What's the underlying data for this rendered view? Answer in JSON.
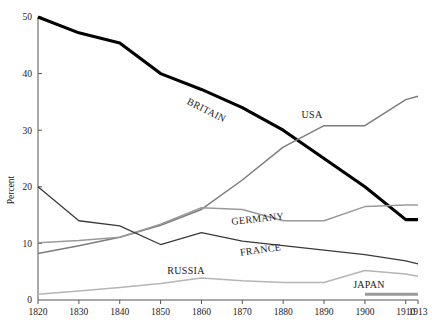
{
  "chart_data": {
    "type": "line",
    "title": "",
    "xlabel": "",
    "ylabel": "Percent",
    "xlim": [
      1820,
      1913
    ],
    "ylim": [
      0,
      50
    ],
    "grid": false,
    "legend": "inline-labels",
    "x": [
      1820,
      1830,
      1840,
      1850,
      1860,
      1870,
      1880,
      1890,
      1900,
      1910,
      1913
    ],
    "xticklabels": [
      "1820",
      "1830",
      "1840",
      "1850",
      "1860",
      "1870",
      "1880",
      "1890",
      "1900",
      "1910",
      "1913"
    ],
    "yticks": [
      0,
      10,
      20,
      30,
      40,
      50
    ],
    "yticklabels": [
      "0",
      "10",
      "20",
      "30",
      "40",
      "50"
    ],
    "series": [
      {
        "name": "BRITAIN",
        "color": "#000000",
        "width": 3.1,
        "values": [
          50.0,
          47.2,
          45.4,
          40.0,
          37.2,
          34.0,
          30.0,
          25.0,
          20.0,
          14.2,
          14.2
        ]
      },
      {
        "name": "USA",
        "color": "#7d7d7d",
        "width": 1.5,
        "values": [
          8.2,
          9.6,
          11.1,
          13.2,
          16.0,
          21.2,
          27.0,
          30.8,
          30.8,
          35.4,
          36.0
        ]
      },
      {
        "name": "GERMANY",
        "color": "#9a9a9a",
        "width": 1.5,
        "values": [
          10.1,
          10.5,
          11.1,
          13.4,
          16.3,
          16.0,
          14.0,
          14.0,
          16.5,
          16.8,
          16.8
        ]
      },
      {
        "name": "FRANCE",
        "color": "#3a3a3a",
        "width": 1.3,
        "values": [
          20.0,
          14.0,
          13.1,
          9.8,
          11.9,
          10.4,
          9.6,
          8.8,
          8.0,
          6.9,
          6.4
        ]
      },
      {
        "name": "RUSSIA",
        "color": "#b5b5b5",
        "width": 1.5,
        "values": [
          1.0,
          1.6,
          2.2,
          2.9,
          3.9,
          3.4,
          3.1,
          3.1,
          5.2,
          4.6,
          4.2
        ]
      },
      {
        "name": "JAPAN",
        "color": "#9a9a9a",
        "width": 3.0,
        "values": [
          null,
          null,
          null,
          null,
          null,
          null,
          null,
          null,
          1.0,
          1.0,
          1.0
        ]
      }
    ],
    "annotations": [
      {
        "label": "BRITAIN",
        "x_px": 205,
        "y_px": 113,
        "rotation": 27
      },
      {
        "label": "USA",
        "x_px": 312,
        "y_px": 118,
        "rotation": 0
      },
      {
        "label": "GERMANY",
        "x_px": 258,
        "y_px": 222,
        "rotation": -6
      },
      {
        "label": "FRANCE",
        "x_px": 261,
        "y_px": 253,
        "rotation": -8
      },
      {
        "label": "RUSSIA",
        "x_px": 186,
        "y_px": 274,
        "rotation": 0
      },
      {
        "label": "JAPAN",
        "x_px": 369,
        "y_px": 288,
        "rotation": 0
      }
    ]
  }
}
